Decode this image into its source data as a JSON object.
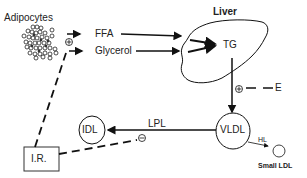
{
  "diagram": {
    "nodes": {
      "adipocytes": "Adipocytes",
      "ffa": "FFA",
      "glycerol": "Glycerol",
      "liver": "Liver",
      "tg": "TG",
      "e": "E",
      "vldl": "VLDL",
      "idl": "IDL",
      "small_ldl": "Small LDL",
      "ir": "I.R."
    },
    "edges": {
      "lpl": "LPL",
      "hl": "HL"
    },
    "signs": {
      "adipocyte_plus": "+",
      "tg_vldl_plus": "+",
      "lpl_minus": "−"
    },
    "colors": {
      "stroke": "#111111",
      "text": "#222222",
      "background": "#ffffff"
    }
  }
}
